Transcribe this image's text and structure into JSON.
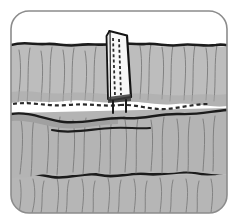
{
  "figure": {
    "alt_text": "Grayscale line drawing of gathered fabric panels joined by a dashed seam, with a white rectangular flap stitched on top",
    "frame": {
      "border_color": "#8c8c8c",
      "background_color": "#ffffff",
      "corner_radius": 18,
      "border_width": 1.5
    },
    "palette": {
      "fabric_light": "#bdbdbd",
      "fabric_mid": "#b0b0b0",
      "fabric_shadow": "#9c9c9c",
      "fold_line": "#6f6f6f",
      "outline_dark": "#1c1c1c",
      "stitch_dash": "#2a2a2a",
      "flap_fill": "#f7f7f7",
      "flap_edge": "#141414"
    },
    "elements": [
      {
        "name": "upper-fabric-panel",
        "label": "Upper gathered fabric panel",
        "fill": "#bdbdbd",
        "pleat_count": 18
      },
      {
        "name": "middle-fabric-panel",
        "label": "Middle gathered fabric panel",
        "fill": "#b4b4b4",
        "pleat_count": 16
      },
      {
        "name": "lower-fabric-panel",
        "label": "Lower gathered fabric panel",
        "fill": "#bdbdbd",
        "pleat_count": 15
      },
      {
        "name": "horizontal-seam-stitch",
        "label": "Dashed horizontal seam stitching",
        "style": "dashed",
        "color": "#2a2a2a",
        "dash_pattern": "4 3"
      },
      {
        "name": "upper-fold-line",
        "label": "Upper dark fold edge",
        "style": "solid",
        "color": "#1c1c1c"
      },
      {
        "name": "lower-fold-line",
        "label": "Lower dark fold edge",
        "style": "solid",
        "color": "#1c1c1c"
      },
      {
        "name": "sewn-flap",
        "label": "White sewn flap / tab",
        "fill": "#f7f7f7",
        "stitch_rows": 2,
        "stitch_style": "dashed"
      }
    ]
  }
}
